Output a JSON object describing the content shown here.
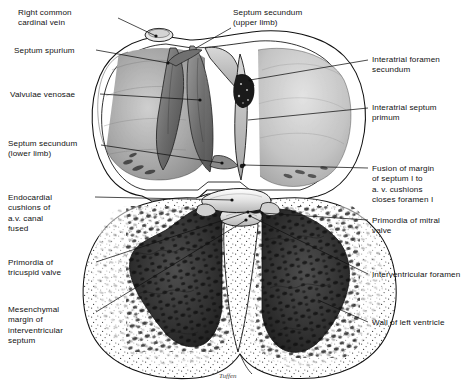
{
  "figure": {
    "kind": "anatomical-illustration",
    "signature": "Tuffen",
    "background_color": "#ffffff",
    "ink_color": "#111111"
  },
  "labels_left": [
    {
      "id": "right-common-cardinal-vein",
      "text": "Right common\ncardinal vein",
      "x": 18,
      "y": 8
    },
    {
      "id": "septum-spurium",
      "text": "Septum spurium",
      "x": 14,
      "y": 46
    },
    {
      "id": "valvulae-venosae",
      "text": "Valvulae venosae",
      "x": 10,
      "y": 90
    },
    {
      "id": "septum-secundum-lower-limb",
      "text": "Septum secundum\n(lower limb)",
      "x": 8,
      "y": 139
    },
    {
      "id": "endocardial-cushions-av-canal-fused",
      "text": "Endocardial\ncushions of\na.v. canal\nfused",
      "x": 8,
      "y": 193
    },
    {
      "id": "primordia-of-tricuspid-valve",
      "text": "Primordia of\ntricuspid valve",
      "x": 8,
      "y": 258
    },
    {
      "id": "mesenchymal-margin-of-interventricular-septum",
      "text": "Mesenchymal\nmargin of\ninterventricular\nseptum",
      "x": 8,
      "y": 305
    }
  ],
  "labels_top": [
    {
      "id": "septum-secundum-upper-limb",
      "text": "Septum secundum\n(upper limb)",
      "x": 233,
      "y": 8
    }
  ],
  "labels_right": [
    {
      "id": "interatrial-foramen-secundum",
      "text": "Interatrial foramen\nsecundum",
      "x": 372,
      "y": 55
    },
    {
      "id": "interatrial-septum-primum",
      "text": "Interatrial septum\nprimum",
      "x": 372,
      "y": 103
    },
    {
      "id": "fusion-of-margin-of-septum-i",
      "text": "Fusion of margin\nof septum I to\na. v. cushions\ncloses foramen I",
      "x": 372,
      "y": 164
    },
    {
      "id": "primordia-of-mitral-valve",
      "text": "Primordia of mitral\nvalve",
      "x": 372,
      "y": 216
    },
    {
      "id": "interventricular-foramen",
      "text": "Interventricular foramen",
      "x": 372,
      "y": 270
    },
    {
      "id": "wall-of-left-ventricle",
      "text": "Wall of left ventricle",
      "x": 372,
      "y": 318
    }
  ],
  "leader_lines": [
    {
      "id": "leader-right-common-cardinal-vein",
      "from": [
        118,
        18
      ],
      "to": [
        156,
        36
      ],
      "dot_at_end": true
    },
    {
      "id": "leader-septum-spurium",
      "from": [
        96,
        50
      ],
      "to": [
        168,
        63
      ],
      "dot_at_end": true
    },
    {
      "id": "leader-valvulae-venosae",
      "from": [
        100,
        94
      ],
      "to": [
        200,
        100
      ],
      "dot_at_end": true
    },
    {
      "id": "leader-septum-secundum-lower-limb",
      "from": [
        101,
        145
      ],
      "to": [
        222,
        163
      ],
      "dot_at_end": true
    },
    {
      "id": "leader-septum-secundum-upper-limb",
      "from": [
        231,
        28
      ],
      "to": [
        196,
        48
      ],
      "dot_at_end": false
    },
    {
      "id": "leader-interatrial-foramen-secundum",
      "from": [
        368,
        60
      ],
      "to": [
        250,
        80
      ],
      "dot_at_end": true
    },
    {
      "id": "leader-interatrial-septum-primum",
      "from": [
        368,
        108
      ],
      "to": [
        248,
        120
      ],
      "dot_at_end": false
    },
    {
      "id": "leader-fusion-of-margin",
      "from": [
        368,
        168
      ],
      "to": [
        244,
        165
      ],
      "dot_at_end": true
    },
    {
      "id": "leader-endocardial-cushions",
      "from": [
        95,
        197
      ],
      "to": [
        232,
        200
      ],
      "dot_at_end": true
    },
    {
      "id": "leader-primordia-mitral-valve",
      "from": [
        368,
        220
      ],
      "to": [
        262,
        213
      ],
      "dot_at_end": true
    },
    {
      "id": "leader-primordia-tricuspid-valve",
      "from": [
        96,
        262
      ],
      "to": [
        248,
        212
      ],
      "dot_at_end": true
    },
    {
      "id": "leader-interventricular-foramen",
      "from": [
        368,
        274
      ],
      "to": [
        250,
        216
      ],
      "dot_at_end": true
    },
    {
      "id": "leader-mesenchymal-margin",
      "from": [
        96,
        312
      ],
      "to": [
        246,
        220
      ],
      "dot_at_end": true
    },
    {
      "id": "leader-wall-of-left-ventricle",
      "from": [
        368,
        322
      ],
      "to": [
        318,
        300
      ],
      "dot_at_end": false
    }
  ],
  "structures": [
    {
      "id": "right-atrium",
      "side": "left",
      "fill": "#9d9d9d"
    },
    {
      "id": "left-atrium",
      "side": "right",
      "fill": "#bdbdbd"
    },
    {
      "id": "right-ventricle",
      "side": "left",
      "fill": "#f4f4f4"
    },
    {
      "id": "left-ventricle",
      "side": "right",
      "fill": "#f4f4f4"
    },
    {
      "id": "trabeculae-carneae",
      "fill": "#3a3a3a"
    },
    {
      "id": "myocardial-wall-stipple",
      "fill": "#ffffff"
    },
    {
      "id": "epicardium-outline",
      "stroke": "#111111"
    }
  ]
}
